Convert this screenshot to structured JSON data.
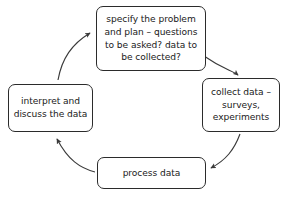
{
  "diagram": {
    "background_color": "#ffffff",
    "border_color": "#2b2b2b",
    "arrow_color": "#3a3a3a",
    "text_color": "#1a1a1a",
    "nodes": [
      {
        "id": "specify",
        "name": "specify-the-problem-and-plan",
        "label": "specify the problem and plan – questions to be asked? data to be collected?",
        "position": "top"
      },
      {
        "id": "collect",
        "name": "collect-data",
        "label": "collect data – surveys, experiments",
        "position": "right"
      },
      {
        "id": "process",
        "name": "process-data",
        "label": "process data",
        "position": "bottom"
      },
      {
        "id": "interpret",
        "name": "interpret-and-discuss-the-data",
        "label": "interpret and discuss the data",
        "position": "left"
      }
    ],
    "edges": [
      {
        "id": "specify-to-collect",
        "from": "specify",
        "to": "collect",
        "style": "curved-arrow"
      },
      {
        "id": "collect-to-process",
        "from": "collect",
        "to": "process",
        "style": "curved-arrow"
      },
      {
        "id": "process-to-interpret",
        "from": "process",
        "to": "interpret",
        "style": "curved-arrow"
      },
      {
        "id": "interpret-to-specify",
        "from": "interpret",
        "to": "specify",
        "style": "curved-arrow"
      }
    ]
  }
}
